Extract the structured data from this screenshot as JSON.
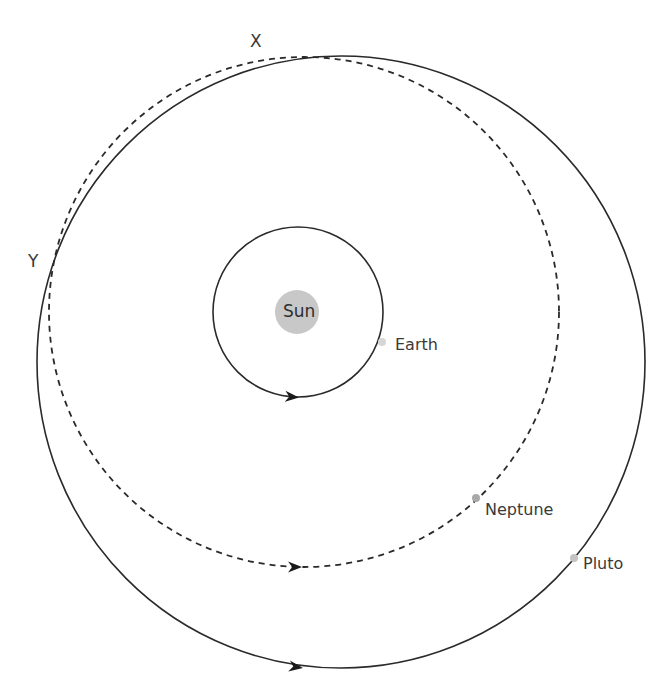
{
  "diagram": {
    "labels": {
      "sun": "Sun",
      "earth": "Earth",
      "neptune": "Neptune",
      "pluto": "Pluto",
      "point_x": "X",
      "point_y": "Y"
    },
    "orbits": [
      {
        "name": "Earth orbit",
        "style": "solid",
        "shape": "circle"
      },
      {
        "name": "Neptune orbit",
        "style": "dashed",
        "shape": "circle"
      },
      {
        "name": "Pluto orbit",
        "style": "solid",
        "shape": "ellipse"
      }
    ],
    "colors": {
      "line": "#2a2a2a",
      "sun_fill": "#c8c8c8",
      "planet_fill": "#bdbdbd",
      "text": "#3a3a3a"
    }
  }
}
